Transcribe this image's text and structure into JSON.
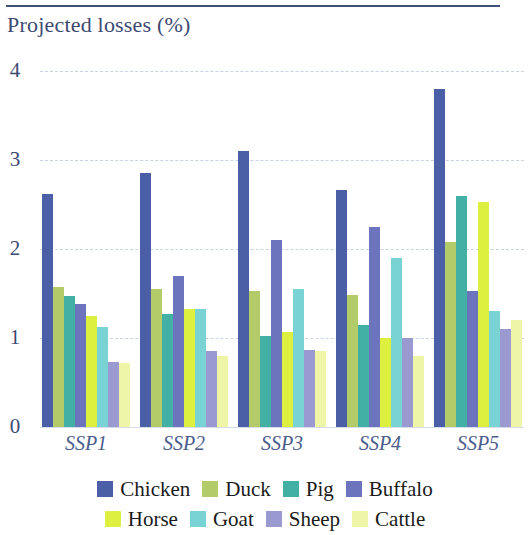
{
  "header": {
    "title": "Projected losses (%)"
  },
  "chart_data": {
    "type": "bar",
    "title": "Projected losses (%)",
    "xlabel": "",
    "ylabel": "Projected losses (%)",
    "ylim": [
      0,
      4
    ],
    "yticks": [
      0,
      1,
      2,
      3,
      4
    ],
    "ytick_labels": [
      "0",
      "1",
      "2",
      "3",
      "4"
    ],
    "grid": true,
    "legend_position": "bottom",
    "categories": [
      "SSP1",
      "SSP2",
      "SSP3",
      "SSP4",
      "SSP5"
    ],
    "series": [
      {
        "name": "Chicken",
        "color": "#4a5fa5",
        "values": [
          2.62,
          2.85,
          3.1,
          2.66,
          3.8
        ]
      },
      {
        "name": "Duck",
        "color": "#b3cc69",
        "values": [
          1.57,
          1.55,
          1.53,
          1.48,
          2.08
        ]
      },
      {
        "name": "Pig",
        "color": "#43b0a5",
        "values": [
          1.47,
          1.27,
          1.02,
          1.15,
          2.6
        ]
      },
      {
        "name": "Buffalo",
        "color": "#6b74bc",
        "values": [
          1.38,
          1.7,
          2.1,
          2.25,
          1.53
        ]
      },
      {
        "name": "Horse",
        "color": "#ddf040",
        "values": [
          1.25,
          1.33,
          1.07,
          1.0,
          2.53
        ]
      },
      {
        "name": "Goat",
        "color": "#79d2d4",
        "values": [
          1.12,
          1.33,
          1.55,
          1.9,
          1.3
        ]
      },
      {
        "name": "Sheep",
        "color": "#9a9ad0",
        "values": [
          0.73,
          0.85,
          0.87,
          1.0,
          1.1
        ]
      },
      {
        "name": "Cattle",
        "color": "#eef5a6",
        "values": [
          0.72,
          0.8,
          0.85,
          0.8,
          1.2
        ]
      }
    ]
  },
  "legend": {
    "rows": [
      [
        "Chicken",
        "Duck",
        "Pig",
        "Buffalo"
      ],
      [
        "Horse",
        "Goat",
        "Sheep",
        "Cattle"
      ]
    ]
  },
  "colors": {
    "axis_text": "#3c4a72",
    "rule": "#3f4f7a",
    "gridline": "#c9d3e4"
  }
}
